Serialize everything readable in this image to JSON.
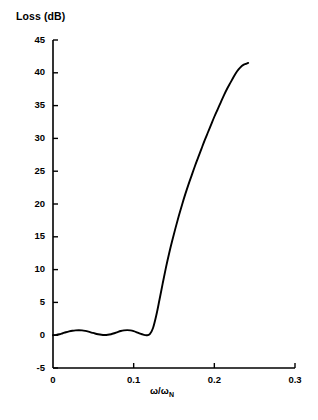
{
  "chart_data": {
    "type": "line",
    "title": "",
    "ylabel": "Loss (dB)",
    "xlabel": "ω/ω",
    "xlabel_sub": "N",
    "xlim": [
      0,
      0.3
    ],
    "ylim": [
      -5,
      45
    ],
    "grid": false,
    "legend": null,
    "xticks": [
      0,
      0.1,
      0.2,
      0.3
    ],
    "xticklabels": [
      "0",
      "0.1",
      "0.2",
      "0.3"
    ],
    "yticks": [
      -5,
      0,
      5,
      10,
      15,
      20,
      25,
      30,
      35,
      40,
      45
    ],
    "yticklabels": [
      "-5",
      "0",
      "5",
      "10",
      "15",
      "20",
      "25",
      "30",
      "35",
      "40",
      "45"
    ],
    "series": [
      {
        "name": "loss",
        "color": "#000000",
        "linewidth": 1.9,
        "x": [
          0.0,
          0.004,
          0.008,
          0.012,
          0.016,
          0.02,
          0.024,
          0.028,
          0.032,
          0.036,
          0.04,
          0.044,
          0.048,
          0.052,
          0.056,
          0.06,
          0.064,
          0.068,
          0.072,
          0.076,
          0.08,
          0.084,
          0.088,
          0.092,
          0.096,
          0.1,
          0.104,
          0.108,
          0.112,
          0.116,
          0.12,
          0.124,
          0.128,
          0.132,
          0.136,
          0.14,
          0.144,
          0.148,
          0.152,
          0.156,
          0.16,
          0.164,
          0.168,
          0.172,
          0.176,
          0.18,
          0.184,
          0.188,
          0.192,
          0.196,
          0.2,
          0.204,
          0.208,
          0.212,
          0.216,
          0.22,
          0.224,
          0.228,
          0.232,
          0.236,
          0.24,
          0.242
        ],
        "y": [
          0.0,
          0.05,
          0.15,
          0.3,
          0.45,
          0.58,
          0.68,
          0.74,
          0.76,
          0.74,
          0.66,
          0.54,
          0.4,
          0.26,
          0.14,
          0.06,
          0.03,
          0.06,
          0.15,
          0.3,
          0.48,
          0.64,
          0.74,
          0.78,
          0.74,
          0.62,
          0.44,
          0.24,
          0.08,
          0.0,
          0.15,
          1.1,
          3.0,
          5.4,
          7.9,
          10.3,
          12.5,
          14.5,
          16.4,
          18.2,
          19.9,
          21.5,
          23.0,
          24.4,
          25.8,
          27.1,
          28.4,
          29.7,
          30.9,
          32.1,
          33.3,
          34.4,
          35.5,
          36.6,
          37.6,
          38.5,
          39.4,
          40.2,
          40.8,
          41.2,
          41.4,
          41.5
        ]
      }
    ]
  },
  "axes": {
    "ylabel_title": "Loss (dB)"
  }
}
